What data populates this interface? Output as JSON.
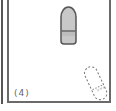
{
  "figure": {
    "panel_label": "(4)",
    "objects": [
      {
        "name": "capsule-solid",
        "style": "filled",
        "fill": "#c8c8c8",
        "stroke": "#555555"
      },
      {
        "name": "capsule-dashed",
        "style": "dashed-outline",
        "stroke": "#777777",
        "rotation_deg": -25
      }
    ]
  }
}
